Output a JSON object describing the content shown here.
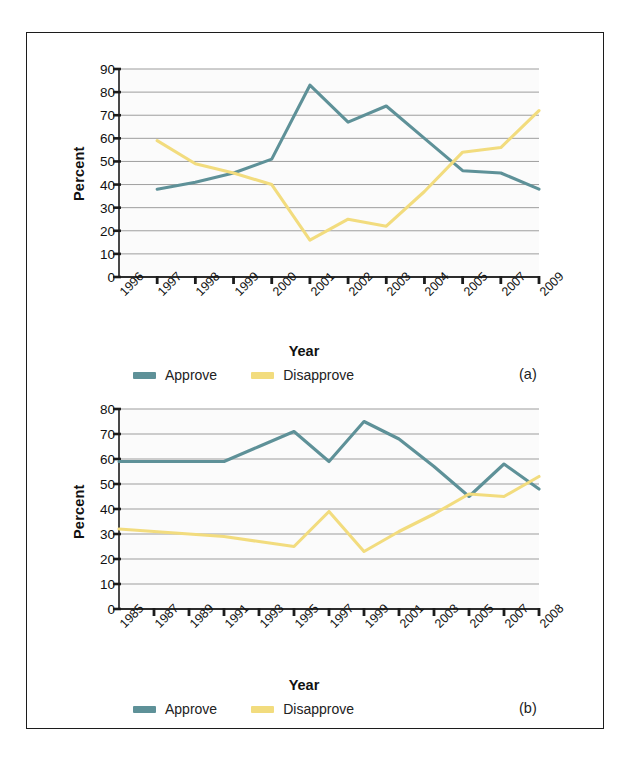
{
  "figure": {
    "panels": [
      {
        "tag": "(a)",
        "axis": {
          "ylabel": "Percent",
          "xlabel": "Year"
        },
        "legend": [
          {
            "label": "Approve",
            "color": "#5e9198"
          },
          {
            "label": "Disapprove",
            "color": "#f2dc7e"
          }
        ],
        "chart_data": {
          "type": "line",
          "title": "",
          "xlabel": "Year",
          "ylabel": "Percent",
          "ylim": [
            0,
            90
          ],
          "yticks": [
            0,
            10,
            20,
            30,
            40,
            50,
            60,
            70,
            80,
            90
          ],
          "grid": true,
          "legend_position": "bottom-left",
          "categories": [
            "1996",
            "1997",
            "1998",
            "1999",
            "2000",
            "2001",
            "2002",
            "2003",
            "2004",
            "2005",
            "2007",
            "2009"
          ],
          "series": [
            {
              "name": "Approve",
              "color": "#5e9198",
              "x": [
                "1997",
                "1998",
                "1999",
                "2000",
                "2001",
                "2002",
                "2003",
                "2004",
                "2005",
                "2007",
                "2009"
              ],
              "values": [
                38,
                41,
                45,
                51,
                83,
                67,
                74,
                60,
                46,
                45,
                38
              ]
            },
            {
              "name": "Disapprove",
              "color": "#f2dc7e",
              "x": [
                "1997",
                "1998",
                "1999",
                "2000",
                "2001",
                "2002",
                "2003",
                "2004",
                "2005",
                "2007",
                "2009"
              ],
              "values": [
                59,
                49,
                45,
                40,
                16,
                25,
                22,
                37,
                54,
                56,
                72
              ]
            }
          ]
        }
      },
      {
        "tag": "(b)",
        "axis": {
          "ylabel": "Percent",
          "xlabel": "Year"
        },
        "legend": [
          {
            "label": "Approve",
            "color": "#5e9198"
          },
          {
            "label": "Disapprove",
            "color": "#f2dc7e"
          }
        ],
        "chart_data": {
          "type": "line",
          "title": "",
          "xlabel": "Year",
          "ylabel": "Percent",
          "ylim": [
            0,
            80
          ],
          "yticks": [
            0,
            10,
            20,
            30,
            40,
            50,
            60,
            70,
            80
          ],
          "grid": true,
          "legend_position": "bottom-left",
          "categories": [
            "1985",
            "1987",
            "1989",
            "1991",
            "1993",
            "1995",
            "1997",
            "1999",
            "2001",
            "2003",
            "2005",
            "2007",
            "2008"
          ],
          "series": [
            {
              "name": "Approve",
              "color": "#5e9198",
              "x": [
                "1985",
                "1987",
                "1989",
                "1991",
                "1993",
                "1995",
                "1997",
                "1999",
                "2001",
                "2003",
                "2005",
                "2007",
                "2008"
              ],
              "values": [
                59,
                59,
                59,
                59,
                65,
                71,
                59,
                75,
                68,
                57,
                45,
                58,
                48
              ]
            },
            {
              "name": "Disapprove",
              "color": "#f2dc7e",
              "x": [
                "1985",
                "1987",
                "1989",
                "1991",
                "1993",
                "1995",
                "1997",
                "1999",
                "2001",
                "2003",
                "2005",
                "2007",
                "2008"
              ],
              "values": [
                32,
                31,
                30,
                29,
                27,
                25,
                39,
                23,
                31,
                38,
                46,
                45,
                53
              ]
            }
          ]
        }
      }
    ]
  }
}
